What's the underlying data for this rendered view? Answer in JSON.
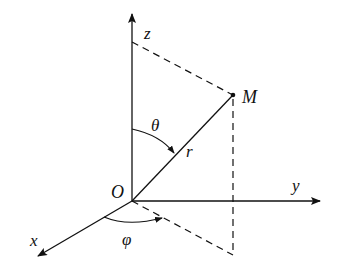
{
  "diagram": {
    "labels": {
      "z_axis": "z",
      "y_axis": "y",
      "x_axis": "x",
      "origin": "O",
      "point": "M",
      "radius": "r",
      "polar_angle": "θ",
      "azimuth_angle": "φ"
    },
    "colors": {
      "stroke": "#111111",
      "background": "#ffffff"
    }
  }
}
